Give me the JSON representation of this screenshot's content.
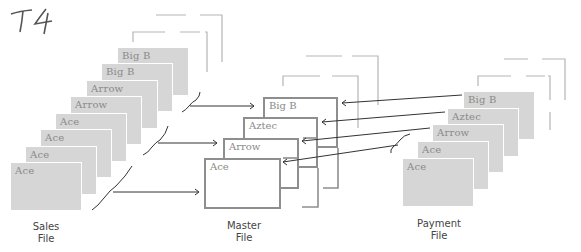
{
  "annotation": {
    "text": "T4"
  },
  "sales_file": {
    "caption_line1": "Sales",
    "caption_line2": "File",
    "records": [
      {
        "label": "Big B"
      },
      {
        "label": "Big B"
      },
      {
        "label": "Arrow"
      },
      {
        "label": "Arrow"
      },
      {
        "label": "Ace"
      },
      {
        "label": "Ace"
      },
      {
        "label": "Ace"
      },
      {
        "label": "Ace"
      }
    ]
  },
  "master_file": {
    "caption_line1": "Master",
    "caption_line2": "File",
    "records": [
      {
        "label": "Big B"
      },
      {
        "label": "Aztec"
      },
      {
        "label": "Arrow"
      },
      {
        "label": "Ace"
      }
    ]
  },
  "payment_file": {
    "caption_line1": "Payment",
    "caption_line2": "File",
    "records": [
      {
        "label": "Big B"
      },
      {
        "label": "Aztec"
      },
      {
        "label": "Arrow"
      },
      {
        "label": "Ace"
      },
      {
        "label": "Ace"
      }
    ]
  },
  "colors": {
    "card_fill": "#d6d6d6",
    "card_label": "#8a8a8a",
    "master_border": "#8e8e8e",
    "line": "#333333",
    "dashed": "#b5b5b5"
  }
}
